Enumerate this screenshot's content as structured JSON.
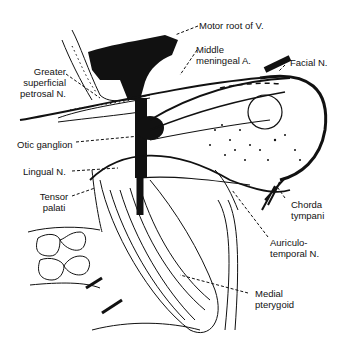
{
  "diagram": {
    "labels": {
      "motor_root": "Motor root of V.",
      "middle_meningeal_1": "Middle",
      "middle_meningeal_2": "meningeal A.",
      "facial": "Facial N.",
      "gsp_1": "Greater",
      "gsp_2": "superficial",
      "gsp_3": "petrosal N.",
      "otic": "Otic ganglion",
      "lingual": "Lingual N.",
      "tensor_1": "Tensor",
      "tensor_2": "palati",
      "chorda_1": "Chorda",
      "chorda_2": "tympani",
      "auriculo_1": "Auriculo-",
      "auriculo_2": "temporal N.",
      "medial_pt_1": "Medial",
      "medial_pt_2": "pterygoid"
    },
    "colors": {
      "ink": "#111111",
      "background": "#ffffff"
    }
  }
}
